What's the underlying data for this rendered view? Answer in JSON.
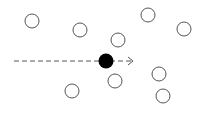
{
  "diagram": {
    "width": 206,
    "height": 140,
    "background": "#ffffff",
    "stroke_color": "#555555",
    "particle_radius": 7,
    "moving_particle": {
      "cx": 106,
      "cy": 61,
      "r": 7.5,
      "fill": "#000000"
    },
    "trajectory": {
      "x1": 14,
      "x2": 132,
      "y": 61,
      "dash": "5 3",
      "color": "#555555",
      "arrow": "open-chevron"
    },
    "static_particles": [
      {
        "cx": 32,
        "cy": 21
      },
      {
        "cx": 80,
        "cy": 30
      },
      {
        "cx": 148,
        "cy": 15
      },
      {
        "cx": 184,
        "cy": 29
      },
      {
        "cx": 118,
        "cy": 40
      },
      {
        "cx": 115,
        "cy": 81
      },
      {
        "cx": 72,
        "cy": 91
      },
      {
        "cx": 159,
        "cy": 74
      },
      {
        "cx": 163,
        "cy": 96
      }
    ]
  }
}
